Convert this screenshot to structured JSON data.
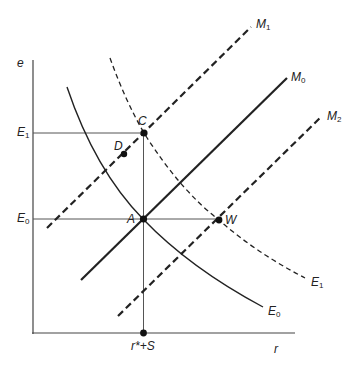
{
  "diagram": {
    "axes": {
      "y_label": "e",
      "x_label": "r",
      "x_tick_label_main": "r*+S",
      "y_ticks": [
        {
          "main": "E",
          "sub": "1",
          "name": "E1"
        },
        {
          "main": "E",
          "sub": "0",
          "name": "E0"
        }
      ]
    },
    "curves": [
      {
        "id": "M0",
        "main": "M",
        "sub": "0",
        "style": "solid",
        "kind": "upward line"
      },
      {
        "id": "M1",
        "main": "M",
        "sub": "1",
        "style": "dashed",
        "kind": "upward line"
      },
      {
        "id": "M2",
        "main": "M",
        "sub": "2",
        "style": "dashed",
        "kind": "upward line"
      },
      {
        "id": "E0",
        "main": "E",
        "sub": "0",
        "style": "solid",
        "kind": "downward curve"
      },
      {
        "id": "E1",
        "main": "E",
        "sub": "1",
        "style": "dashed",
        "kind": "downward curve"
      }
    ],
    "points": [
      {
        "id": "A",
        "label": "A"
      },
      {
        "id": "C",
        "label": "C"
      },
      {
        "id": "D",
        "label": "D"
      },
      {
        "id": "W",
        "label": "W"
      }
    ],
    "colors": {
      "line": "#222222",
      "thin_line": "#444444",
      "background": "#ffffff"
    }
  }
}
